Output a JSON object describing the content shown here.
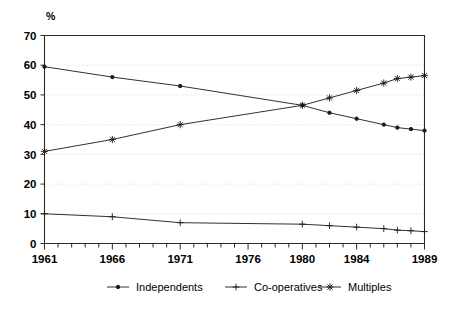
{
  "chart_data": {
    "type": "line",
    "title": "",
    "subtitle": "",
    "xlabel": "",
    "ylabel": "%",
    "unit_label": "%",
    "xlim": [
      1961,
      1989
    ],
    "ylim": [
      0,
      70
    ],
    "ytick_step": 10,
    "yticks": [
      0,
      10,
      20,
      30,
      40,
      50,
      60,
      70
    ],
    "ytick_labels": [
      "0",
      "10",
      "20",
      "30",
      "40",
      "50",
      "60",
      "70"
    ],
    "xticks_all": [
      1961,
      1962,
      1963,
      1964,
      1965,
      1966,
      1967,
      1968,
      1969,
      1970,
      1971,
      1972,
      1973,
      1974,
      1975,
      1976,
      1977,
      1978,
      1979,
      1980,
      1981,
      1982,
      1983,
      1984,
      1985,
      1986,
      1987,
      1988,
      1989
    ],
    "xtick_labels": [
      {
        "value": 1961,
        "label": "1961"
      },
      {
        "value": 1966,
        "label": "1966"
      },
      {
        "value": 1971,
        "label": "1971"
      },
      {
        "value": 1976,
        "label": "1976"
      },
      {
        "value": 1980,
        "label": "1980"
      },
      {
        "value": 1984,
        "label": "1984"
      },
      {
        "value": 1989,
        "label": "1989"
      }
    ],
    "grid": "horizontal-dotted",
    "legend_position": "bottom",
    "series": [
      {
        "name": "Independents",
        "marker": "dot",
        "color": "#1a1a1a",
        "x": [
          1961,
          1966,
          1971,
          1980,
          1982,
          1984,
          1986,
          1987,
          1988,
          1989
        ],
        "values": [
          59.5,
          56,
          53,
          46.5,
          44,
          42,
          40,
          39,
          38.5,
          38
        ]
      },
      {
        "name": "Co-operatives",
        "marker": "plus",
        "color": "#1a1a1a",
        "x": [
          1961,
          1966,
          1971,
          1980,
          1982,
          1984,
          1986,
          1987,
          1988,
          1989
        ],
        "values": [
          10,
          9,
          7,
          6.5,
          6,
          5.5,
          5,
          4.5,
          4.3,
          4
        ]
      },
      {
        "name": "Multiples",
        "marker": "star",
        "color": "#1a1a1a",
        "x": [
          1961,
          1966,
          1971,
          1980,
          1982,
          1984,
          1986,
          1987,
          1988,
          1989
        ],
        "values": [
          31,
          35,
          40,
          46.5,
          49,
          51.5,
          54,
          55.5,
          56,
          56.5
        ]
      }
    ]
  },
  "legend": {
    "items": [
      {
        "label": "Independents",
        "marker": "dot"
      },
      {
        "label": "Co-operatives",
        "marker": "plus"
      },
      {
        "label": "Multiples",
        "marker": "star"
      }
    ]
  }
}
